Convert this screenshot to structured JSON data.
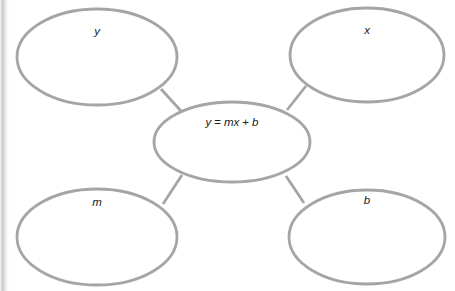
{
  "diagram": {
    "type": "concept-map",
    "stroke_color": "#a5a5a5",
    "text_color": "#1b1b1b",
    "background_color": "#ffffff",
    "center": {
      "id": "center-equation",
      "label": "y = mx + b",
      "parts": {
        "lhs": "y",
        "equals": "=",
        "slope": "m",
        "variable": "x",
        "plus": "+",
        "intercept": "b"
      },
      "cx": 232,
      "cy": 142,
      "rx": 78,
      "ry": 40
    },
    "nodes": [
      {
        "id": "node-y",
        "label": "y",
        "position": "top-left",
        "cx": 97,
        "cy": 57,
        "rx": 80,
        "ry": 48,
        "label_x": 97,
        "label_y": 35
      },
      {
        "id": "node-x",
        "label": "x",
        "position": "top-right",
        "cx": 367,
        "cy": 55,
        "rx": 77,
        "ry": 47,
        "label_x": 367,
        "label_y": 34
      },
      {
        "id": "node-m",
        "label": "m",
        "position": "bottom-left",
        "cx": 97,
        "cy": 237,
        "rx": 80,
        "ry": 48,
        "label_x": 97,
        "label_y": 206
      },
      {
        "id": "node-b",
        "label": "b",
        "position": "bottom-right",
        "cx": 367,
        "cy": 237,
        "rx": 78,
        "ry": 47,
        "label_x": 367,
        "label_y": 204
      }
    ],
    "connectors": [
      {
        "id": "connector-y-center",
        "from": "node-y",
        "to": "center-equation",
        "x1": 161,
        "y1": 89,
        "x2": 181,
        "y2": 111
      },
      {
        "id": "connector-x-center",
        "from": "node-x",
        "to": "center-equation",
        "x1": 306,
        "y1": 86,
        "x2": 287,
        "y2": 110
      },
      {
        "id": "connector-m-center",
        "from": "node-m",
        "to": "center-equation",
        "x1": 163,
        "y1": 204,
        "x2": 182,
        "y2": 175
      },
      {
        "id": "connector-b-center",
        "from": "node-b",
        "to": "center-equation",
        "x1": 304,
        "y1": 203,
        "x2": 286,
        "y2": 176
      }
    ]
  }
}
